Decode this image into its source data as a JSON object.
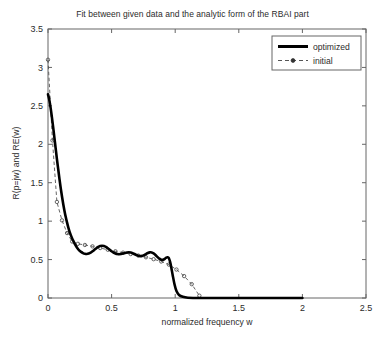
{
  "chart_data": {
    "type": "line",
    "title": "Fit between given data and the analytic form of the RBAI part",
    "xlabel": "normalized frequency w",
    "ylabel": "R(p=jw) and RE(w)",
    "xlim": [
      0,
      2.5
    ],
    "ylim": [
      0,
      3.5
    ],
    "xticks": [
      0,
      0.5,
      1,
      1.5,
      2,
      2.5
    ],
    "xticklabels": [
      "0",
      "0.5",
      "1",
      "1.5",
      "2",
      "2.5"
    ],
    "yticks": [
      0,
      0.5,
      1,
      1.5,
      2,
      2.5,
      3,
      3.5
    ],
    "yticklabels": [
      "0",
      "0.5",
      "1",
      "1.5",
      "2",
      "2.5",
      "3",
      "3.5"
    ],
    "grid": false,
    "legend_position": "upper right",
    "series": [
      {
        "name": "optimized",
        "style": "solid",
        "linewidth": 2.6,
        "color": "#000000",
        "marker": "none",
        "x": [
          0.0,
          0.01,
          0.02,
          0.03,
          0.04,
          0.05,
          0.06,
          0.07,
          0.08,
          0.09,
          0.1,
          0.11,
          0.12,
          0.13,
          0.14,
          0.15,
          0.16,
          0.17,
          0.18,
          0.19,
          0.2,
          0.215,
          0.23,
          0.245,
          0.26,
          0.275,
          0.29,
          0.305,
          0.32,
          0.335,
          0.35,
          0.365,
          0.38,
          0.395,
          0.41,
          0.425,
          0.44,
          0.455,
          0.47,
          0.485,
          0.5,
          0.515,
          0.53,
          0.545,
          0.56,
          0.575,
          0.59,
          0.605,
          0.62,
          0.635,
          0.65,
          0.665,
          0.68,
          0.695,
          0.71,
          0.725,
          0.74,
          0.755,
          0.77,
          0.785,
          0.8,
          0.815,
          0.83,
          0.845,
          0.86,
          0.875,
          0.89,
          0.905,
          0.92,
          0.93,
          0.94,
          0.95,
          0.96,
          0.97,
          0.98,
          0.995,
          1.01,
          1.03,
          1.06,
          1.1,
          1.2,
          1.4,
          1.6,
          1.8,
          2.0
        ],
        "y": [
          2.65,
          2.58,
          2.48,
          2.36,
          2.23,
          2.09,
          1.95,
          1.81,
          1.68,
          1.55,
          1.43,
          1.32,
          1.22,
          1.13,
          1.05,
          0.98,
          0.915,
          0.86,
          0.815,
          0.775,
          0.74,
          0.69,
          0.65,
          0.62,
          0.6,
          0.585,
          0.575,
          0.572,
          0.578,
          0.59,
          0.608,
          0.628,
          0.648,
          0.665,
          0.676,
          0.68,
          0.676,
          0.665,
          0.648,
          0.628,
          0.608,
          0.592,
          0.58,
          0.572,
          0.57,
          0.572,
          0.578,
          0.586,
          0.592,
          0.595,
          0.592,
          0.584,
          0.572,
          0.56,
          0.55,
          0.545,
          0.548,
          0.558,
          0.572,
          0.586,
          0.594,
          0.592,
          0.58,
          0.56,
          0.535,
          0.512,
          0.498,
          0.498,
          0.512,
          0.525,
          0.53,
          0.52,
          0.47,
          0.39,
          0.3,
          0.175,
          0.09,
          0.04,
          0.015,
          0.004,
          0.0,
          0.0,
          0.0,
          0.0,
          0.0
        ]
      },
      {
        "name": "initial",
        "style": "dashed",
        "linewidth": 0.9,
        "color": "#555555",
        "marker": "circle",
        "x": [
          0.0,
          0.035,
          0.07,
          0.11,
          0.15,
          0.19,
          0.235,
          0.29,
          0.35,
          0.41,
          0.47,
          0.53,
          0.59,
          0.65,
          0.71,
          0.77,
          0.83,
          0.89,
          0.95,
          1.01,
          1.07,
          1.13,
          1.19
        ],
        "y": [
          3.1,
          2.05,
          1.25,
          1.01,
          0.845,
          0.735,
          0.705,
          0.69,
          0.672,
          0.65,
          0.628,
          0.608,
          0.59,
          0.572,
          0.552,
          0.53,
          0.505,
          0.475,
          0.435,
          0.37,
          0.285,
          0.18,
          0.03
        ]
      }
    ]
  },
  "legend": {
    "entries": [
      {
        "label": "optimized",
        "sample": "solid-thick"
      },
      {
        "label": "initial",
        "sample": "dashed-marker"
      }
    ]
  },
  "colors": {
    "axis": "#666666",
    "text": "#2b2b2b",
    "optimized": "#000000",
    "initial": "#555555",
    "background": "#ffffff"
  }
}
